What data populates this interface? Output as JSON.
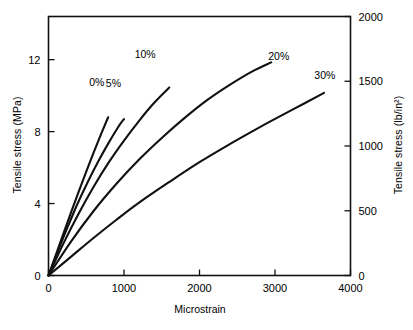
{
  "chart_data": {
    "type": "line",
    "title": "",
    "xlabel": "Microstrain",
    "ylabel": "Tensile stress (MPa)",
    "ylabel_secondary": "Tensile stress (lb/in²)",
    "xlim": [
      0,
      4000
    ],
    "ylim": [
      0,
      14.4
    ],
    "ylim_secondary": [
      0,
      2000
    ],
    "grid": false,
    "legend": "inline-annotations",
    "xticks": [
      0,
      1000,
      2000,
      3000,
      4000
    ],
    "xtick_labels": [
      "0",
      "1000",
      "2000",
      "3000",
      "4000"
    ],
    "yticks": [
      0,
      4,
      8,
      12
    ],
    "ytick_labels": [
      "0",
      "4",
      "8",
      "12"
    ],
    "yticks_secondary": [
      0,
      500,
      1000,
      1500,
      2000
    ],
    "ytick_labels_secondary": [
      "0",
      "500",
      "1000",
      "1500",
      "2000"
    ],
    "series": [
      {
        "name": "0%",
        "label": "0%",
        "label_x": 640,
        "label_y": 10.55,
        "x": [
          0,
          100,
          200,
          300,
          400,
          500,
          600,
          700,
          790
        ],
        "y": [
          0,
          1.18,
          2.36,
          3.52,
          4.66,
          5.78,
          6.86,
          7.9,
          8.8
        ]
      },
      {
        "name": "5%",
        "label": "5%",
        "label_x": 860,
        "label_y": 10.5,
        "x": [
          0,
          120,
          250,
          380,
          520,
          660,
          800,
          930,
          1000
        ],
        "y": [
          0,
          1.3,
          2.66,
          3.95,
          5.2,
          6.35,
          7.4,
          8.3,
          8.7
        ]
      },
      {
        "name": "10%",
        "label": "10%",
        "label_x": 1280,
        "label_y": 12.1,
        "x": [
          0,
          200,
          400,
          600,
          800,
          1000,
          1200,
          1400,
          1600
        ],
        "y": [
          0,
          1.8,
          3.45,
          4.95,
          6.3,
          7.5,
          8.6,
          9.6,
          10.45
        ]
      },
      {
        "name": "20%",
        "label": "20%",
        "label_x": 3050,
        "label_y": 12.0,
        "x": [
          0,
          300,
          600,
          900,
          1200,
          1500,
          1800,
          2100,
          2400,
          2700,
          2950
        ],
        "y": [
          0,
          1.9,
          3.6,
          5.1,
          6.45,
          7.65,
          8.75,
          9.75,
          10.6,
          11.35,
          11.85
        ]
      },
      {
        "name": "30%",
        "label": "30%",
        "label_x": 3660,
        "label_y": 10.95,
        "x": [
          0,
          300,
          600,
          900,
          1200,
          1600,
          2000,
          2400,
          2800,
          3200,
          3650
        ],
        "y": [
          0,
          1.05,
          2.1,
          3.1,
          4.05,
          5.2,
          6.3,
          7.3,
          8.25,
          9.15,
          10.15
        ]
      }
    ]
  }
}
